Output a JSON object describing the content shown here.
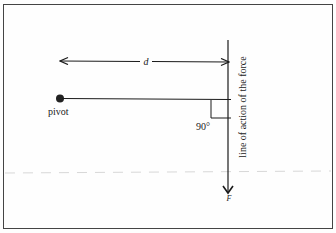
{
  "diagram": {
    "type": "torque / moment arm diagram",
    "labels": {
      "distance": "d",
      "pivot": "pivot",
      "angle": "90°",
      "line_of_action": "line of action of the force",
      "force": "F"
    },
    "colors": {
      "ink": "#1a1a1a",
      "border": "#444444",
      "dashed": "#d8d8d8",
      "background": "#fefefe"
    }
  }
}
